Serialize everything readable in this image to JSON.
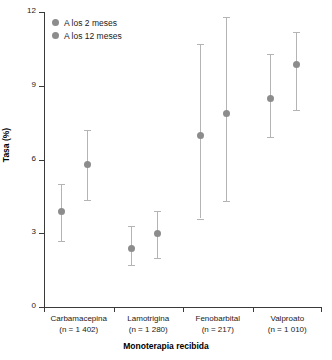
{
  "chart_data": {
    "type": "scatter",
    "title": "",
    "xlabel": "Monoterapia recibida",
    "ylabel": "Tasa (%)",
    "ylim": [
      0,
      12
    ],
    "yticks": [
      0,
      3,
      6,
      9,
      12
    ],
    "ytick_labels": [
      "0",
      "3",
      "6",
      "9",
      "12"
    ],
    "grid": false,
    "legend_position": "top-left",
    "categories": [
      "Carbamacepina",
      "Lamotrigina",
      "Fenobarbital",
      "Valproato"
    ],
    "category_counts": [
      "(n = 1 402)",
      "(n = 1 280)",
      "(n = 217)",
      "(n = 1 010)"
    ],
    "series": [
      {
        "name": "A los 2 meses",
        "color": "#8c8c8c",
        "values": [
          3.9,
          2.4,
          7.0,
          8.5
        ],
        "ci_low": [
          2.7,
          1.7,
          3.6,
          6.9
        ],
        "ci_high": [
          5.0,
          3.3,
          10.7,
          10.3
        ]
      },
      {
        "name": "A los 12 meses",
        "color": "#8c8c8c",
        "values": [
          5.8,
          3.0,
          7.9,
          9.9
        ],
        "ci_low": [
          4.35,
          2.0,
          4.3,
          8.0
        ],
        "ci_high": [
          7.2,
          3.9,
          11.8,
          11.2
        ]
      }
    ]
  },
  "legend": {
    "items": [
      {
        "label": "A los 2 meses"
      },
      {
        "label": "A los 12 meses"
      }
    ]
  }
}
